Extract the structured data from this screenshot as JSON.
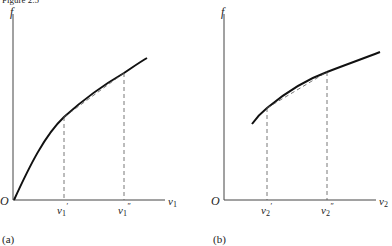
{
  "header_text": "Figure 2.5",
  "panels": [
    {
      "id": "a",
      "caption": "(a)",
      "y_label": "f",
      "x_label": "v",
      "x_label_sub": "1",
      "origin_label": "O",
      "tick1_label": "v",
      "tick1_sub": "1",
      "tick1_prime": "′",
      "tick2_label": "v",
      "tick2_sub": "1",
      "tick2_prime": "″"
    },
    {
      "id": "b",
      "caption": "(b)",
      "y_label": "f",
      "x_label": "v",
      "x_label_sub": "2",
      "origin_label": "O",
      "tick1_label": "v",
      "tick1_sub": "2",
      "tick1_prime": "′",
      "tick2_label": "v",
      "tick2_sub": "2",
      "tick2_prime": "″"
    }
  ],
  "colors": {
    "ink": "#111111",
    "dash": "#555555"
  }
}
